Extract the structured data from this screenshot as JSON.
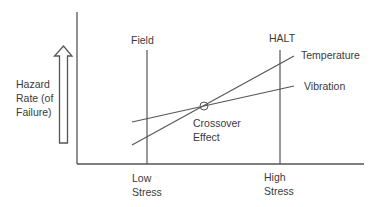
{
  "y_axis_label": {
    "line1": "Hazard",
    "line2": "Rate (of",
    "line3": "Failure)"
  },
  "columns": {
    "field": "Field",
    "halt": "HALT"
  },
  "series": {
    "temperature": "Temperature",
    "vibration": "Vibration"
  },
  "crossover": {
    "line1": "Crossover",
    "line2": "Effect"
  },
  "x_ticks": {
    "low": {
      "line1": "Low",
      "line2": "Stress"
    },
    "high": {
      "line1": "High",
      "line2": "Stress"
    }
  },
  "colors": {
    "line": "#555555",
    "text": "#3a3a3a"
  }
}
